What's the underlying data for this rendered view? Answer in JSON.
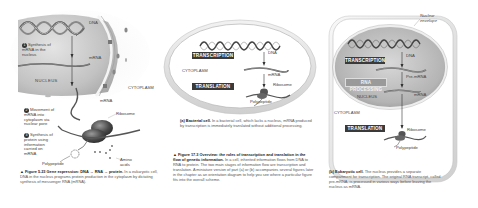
{
  "panel_left": {
    "labels": {
      "dna": "DNA",
      "mrna_top": "mRNA",
      "nucleus": "NUCLEUS",
      "cytoplasm": "CYTOPLASM",
      "mrna_mid": "mRNA",
      "ribosome": "Ribosome",
      "amino_acids": "Amino acids",
      "polypeptide": "Polypeptide"
    },
    "steps": [
      {
        "num": "1",
        "text": "Synthesis of mRNA in the nucleus"
      },
      {
        "num": "2",
        "text": "Movement of mRNA into cytoplasm via nuclear pore"
      },
      {
        "num": "3",
        "text": "Synthesis of protein using information carried on mRNA"
      }
    ],
    "caption": {
      "figure": "▲ Figure 5.23",
      "title": "Gene expression: DNA → RNA → protein.",
      "body": "In a eukaryotic cell, DNA in the nucleus programs protein production in the cytoplasm by dictating synthesis of messenger RNA (mRNA)."
    }
  },
  "panel_middle": {
    "labels": {
      "transcription": "TRANSCRIPTION",
      "translation": "TRANSLATION",
      "cytoplasm": "CYTOPLASM",
      "dna": "DNA",
      "mrna": "mRNA",
      "ribosome": "Ribosome",
      "polypeptide": "Polypeptide"
    },
    "caption": {
      "part": "(a) Bacterial cell.",
      "body": "In a bacterial cell, which lacks a nucleus, mRNA produced by transcription is immediately translated without additional processing."
    },
    "figure_caption": {
      "figure": "▲ Figure 17.3",
      "title": "Overview: the roles of transcription and translation in the flow of genetic information.",
      "body": "In a cell, inherited information flows from DNA to RNA to protein. The two main stages of information flow are transcription and translation. A miniature version of part (a) or (b) accompanies several figures later in the chapter as an orientation diagram to help you see where a particular figure fits into the overall scheme."
    }
  },
  "panel_right": {
    "labels": {
      "nuclear_envelope": "Nuclear envelope",
      "transcription": "TRANSCRIPTION",
      "rna_processing": "RNA PROCESSING",
      "dna": "DNA",
      "pre_mrna": "Pre-mRNA",
      "mrna": "mRNA",
      "nucleus": "NUCLEUS",
      "cytoplasm": "CYTOPLASM",
      "translation": "TRANSLATION",
      "ribosome": "Ribosome",
      "polypeptide": "Polypeptide"
    },
    "caption": {
      "part": "(b) Eukaryotic cell.",
      "body": "The nucleus provides a separate compartment for transcription. The original RNA transcript, called pre-mRNA, is processed in various ways before leaving the nucleus as mRNA."
    }
  },
  "colors": {
    "label_box": "#3a3a3a",
    "label_box_light": "#9a9a9a",
    "nucleus_fill": "#b8b8b8",
    "cell_outline": "#d6d6d6"
  }
}
